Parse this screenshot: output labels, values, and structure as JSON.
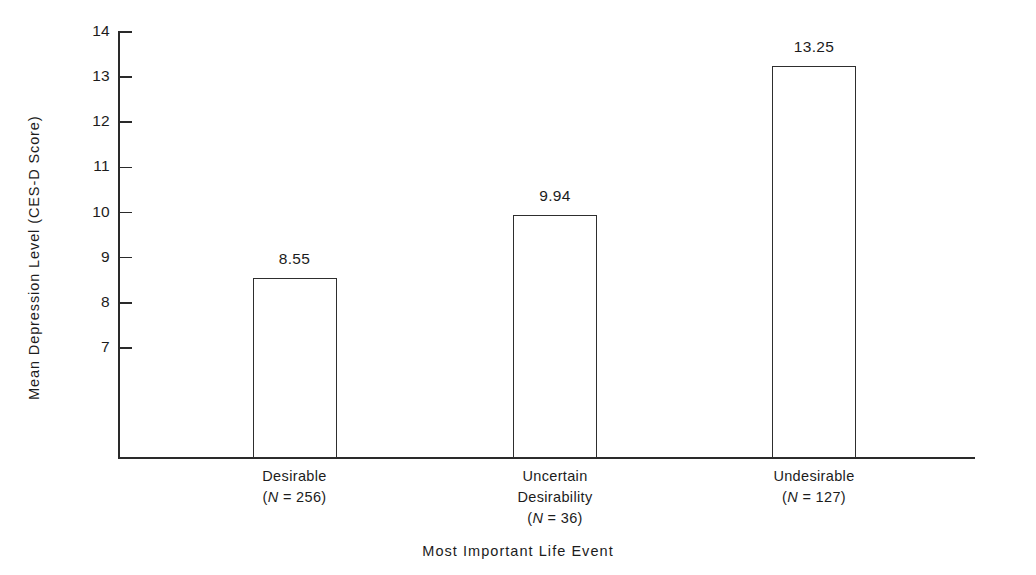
{
  "chart_data": {
    "type": "bar",
    "title": "",
    "xlabel": "Most Important Life Event",
    "ylabel": "Mean Depression Level  (CES-D Score)",
    "categories": [
      "Desirable",
      "Uncertain Desirability",
      "Undesirable"
    ],
    "values": [
      8.55,
      9.94,
      13.25
    ],
    "value_labels": [
      "8.55",
      "9.94",
      "13.25"
    ],
    "group_sizes": [
      256,
      36,
      127
    ],
    "ylim": [
      6.4,
      14
    ],
    "yticks": [
      7,
      8,
      9,
      10,
      11,
      12,
      13,
      14
    ],
    "ytick_labels": [
      "7",
      "8",
      "9",
      "10",
      "11",
      "12",
      "13",
      "14"
    ],
    "grid": false,
    "legend": null,
    "axis_break": true,
    "bar_fill": "#ffffff",
    "bar_outline": "#2e2e2e",
    "axis_color": "#2a2a2a",
    "background": "#ffffff"
  },
  "category_lines": [
    [
      "Desirable"
    ],
    [
      "Uncertain",
      "Desirability"
    ],
    [
      "Undesirable"
    ]
  ],
  "n_labels": [
    "(N = 256)",
    "(N = 36)",
    "(N = 127)"
  ],
  "n_parts": [
    {
      "open": "(",
      "sym": "N",
      "rest": " = 256)"
    },
    {
      "open": "(",
      "sym": "N",
      "rest": " = 36)"
    },
    {
      "open": "(",
      "sym": "N",
      "rest": " = 127)"
    }
  ]
}
